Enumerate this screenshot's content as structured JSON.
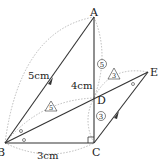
{
  "diagram": {
    "points": {
      "A": {
        "label": "A",
        "x": 94,
        "y": 17
      },
      "B": {
        "label": "B",
        "x": 5,
        "y": 143
      },
      "C": {
        "label": "C",
        "x": 94,
        "y": 143
      },
      "D": {
        "label": "D",
        "x": 94,
        "y": 98
      },
      "E": {
        "label": "E",
        "x": 148,
        "y": 72
      }
    },
    "lengths": {
      "AB": "5cm",
      "AC": "4cm",
      "BC": "3cm"
    },
    "ratio_marks": {
      "AD_circle": "5",
      "DC_circle": "3",
      "BD_triangle": "5",
      "DE_triangle": "3"
    },
    "colors": {
      "line": "#333333",
      "dotted": "#aaaaaa",
      "text": "#222222"
    }
  }
}
